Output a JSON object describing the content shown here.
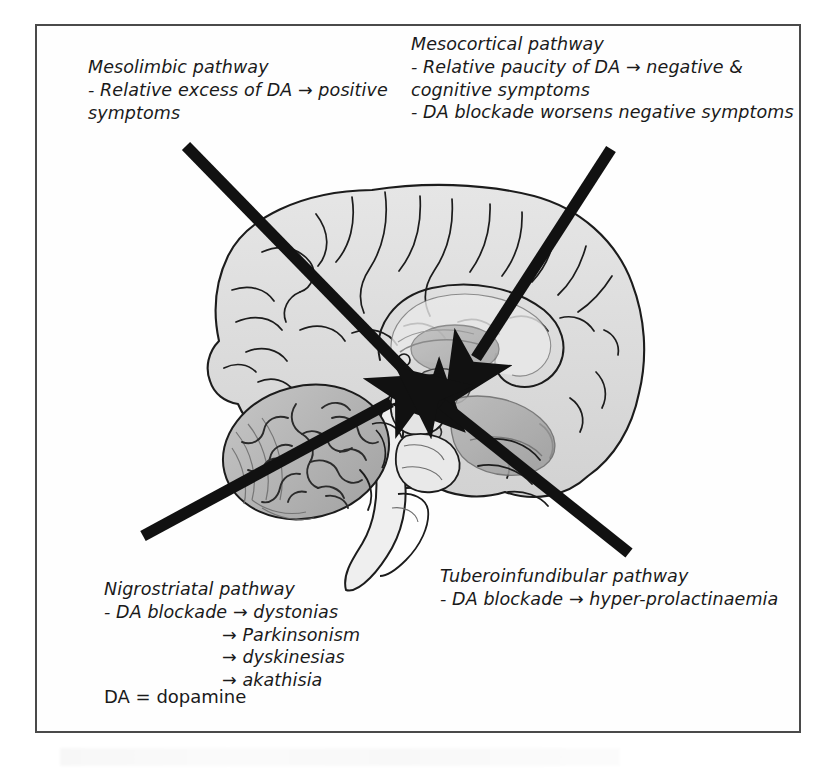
{
  "figure": {
    "legend": "DA = dopamine",
    "arrow_glyph": "→"
  },
  "labels": {
    "mesolimbic": {
      "title": "Mesolimbic pathway",
      "lines": [
        "- Relative excess of DA → positive",
        "symptoms"
      ]
    },
    "mesocortical": {
      "title": "Mesocortical pathway",
      "lines": [
        "- Relative paucity of DA → negative &",
        "cognitive symptoms",
        "- DA blockade worsens negative symptoms"
      ]
    },
    "nigrostriatal": {
      "title": "Nigrostriatal pathway",
      "lines": [
        "- DA blockade → dystonias"
      ],
      "sub_effects": [
        "→ Parkinsonism",
        "→ dyskinesias",
        "→ akathisia"
      ]
    },
    "tuberoinfundibular": {
      "title": "Tuberoinfundibular pathway",
      "lines": [
        "- DA blockade → hyper-prolactinaemia"
      ]
    }
  },
  "pointers": [
    {
      "name": "mesolimbic-arrow",
      "from": [
        186,
        146
      ],
      "to": [
        432,
        398
      ]
    },
    {
      "name": "mesocortical-arrow",
      "from": [
        611,
        149
      ],
      "to": [
        468,
        368
      ]
    },
    {
      "name": "nigrostriatal-arrow",
      "from": [
        143,
        536
      ],
      "to": [
        399,
        397
      ]
    },
    {
      "name": "tuberoinfundibular-arrow",
      "from": [
        629,
        553
      ],
      "to": [
        432,
        396
      ]
    }
  ],
  "colors": {
    "frame_border": "#4a4a4a",
    "arrow": "#111111",
    "text": "#1a1a1a",
    "brain_cortex": "#dcdcdc",
    "brain_outline": "#1c1c1c",
    "cerebellum": "#b4b4b4",
    "brainstem": "#ededed",
    "deep_structures": "#a9a9a9",
    "background": "#ffffff"
  },
  "anatomy": [
    "cerebral-cortex",
    "corpus-callosum",
    "thalamus",
    "hypothalamus",
    "midbrain",
    "pons",
    "medulla",
    "cerebellum",
    "arbor-vitae"
  ]
}
